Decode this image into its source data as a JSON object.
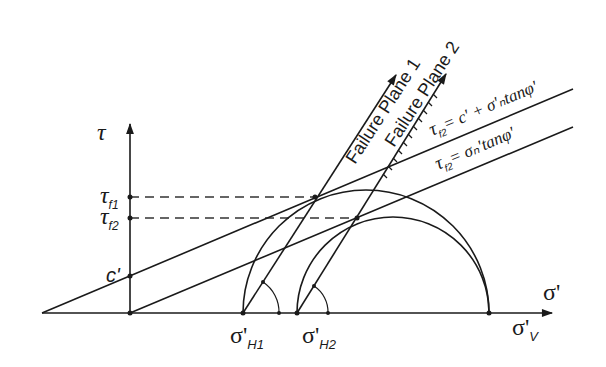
{
  "diagram": {
    "axes": {
      "y_label": "τ",
      "x_label": "σ'"
    },
    "y_ticks": {
      "tau_f1": {
        "main": "τ",
        "sub": "f1"
      },
      "tau_f2": {
        "main": "τ",
        "sub": "f2"
      },
      "c": "c'"
    },
    "x_ticks": {
      "sigma_h1": {
        "main": "σ'",
        "sub": "H1"
      },
      "sigma_h2": {
        "main": "σ'",
        "sub": "H2"
      },
      "sigma_v": {
        "main": "σ'",
        "sub": "V"
      }
    },
    "failure_planes": [
      {
        "label": "Failure Plane 1"
      },
      {
        "label": "Failure Plane 2"
      }
    ],
    "envelopes": [
      {
        "main": "τ",
        "sub": "f2",
        "rhs": "= c' + σ'ₙtanφ'"
      },
      {
        "main": "τ",
        "sub": "f2",
        "rhs": "= σₙ'tanφ'"
      }
    ]
  }
}
